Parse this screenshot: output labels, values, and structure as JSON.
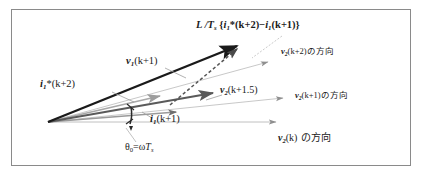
{
  "figure": {
    "type": "vector-phasor-diagram",
    "border_color": "#8a8a8a",
    "background": "#ffffff",
    "labels": {
      "ldt_prefix": "L /T",
      "ldt_sub": "s",
      "ldt_open": " {",
      "ldt_i1": "i",
      "ldt_i1_sub": "1",
      "ldt_star": "*",
      "ldt_k2": "(k+2)",
      "ldt_minus": "−",
      "ldt_i1b": "i",
      "ldt_i1b_sub": "1",
      "ldt_k1": "(k+1)}",
      "v1k1_v": "v",
      "v1k1_sub": "1",
      "v1k1_arg": "(k+1)",
      "i1star_i": "i",
      "i1star_sub": "1",
      "i1star_star": "*",
      "i1star_arg": "(k+2)",
      "v2k15_v": "v",
      "v2k15_sub": "2",
      "v2k15_arg": "(k+1.5)",
      "i1k1_i": "i",
      "i1k1_sub": "1",
      "i1k1_arg": "(k+1)",
      "dir_k2_v": "v",
      "dir_k2_sub": "2",
      "dir_k2_arg": "(k+2)",
      "dir_k2_jp": "の方向",
      "dir_k1_v": "v",
      "dir_k1_sub": "2",
      "dir_k1_arg": "(k+1)",
      "dir_k1_jp": "の方向",
      "dir_k0_v": "v",
      "dir_k0_sub": "2",
      "dir_k0_arg": "(k)",
      "dir_k0_jp": " の方向",
      "theta_sym": "θ",
      "theta_sub": "0",
      "theta_eq": "=ω",
      "theta_T": "T",
      "theta_T_sub": "s"
    },
    "colors": {
      "vector_bold": "#1a1a1a",
      "vector_mid": "#5a5a5a",
      "vector_light": "#a8a8a8",
      "vector_faint": "#c4c4c4",
      "dashed": "#6b6b6b",
      "leader": "#b0b0b0",
      "text": "#1a1a1a"
    },
    "geometry": {
      "origin": [
        48,
        122
      ],
      "v1_tip": [
        243,
        44
      ],
      "i1star_tip": [
        166,
        96
      ],
      "v2k15_tip": [
        219,
        92
      ],
      "i1k1_tip": [
        182,
        112
      ],
      "dir_k2_tip": [
        273,
        62
      ],
      "dir_k1_tip": [
        288,
        98
      ],
      "dir_k0_tip": [
        282,
        122
      ],
      "dashed_start": [
        170,
        104
      ],
      "dashed_end": [
        240,
        48
      ]
    }
  }
}
